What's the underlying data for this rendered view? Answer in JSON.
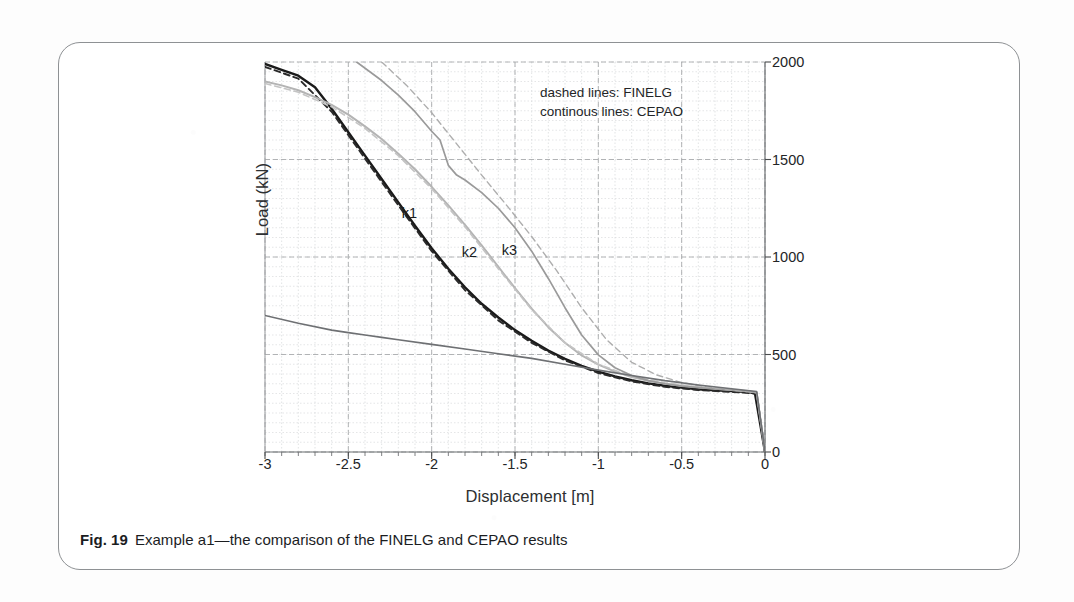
{
  "figure": {
    "caption_number": "Fig. 19",
    "caption_text": "Example a1—the comparison of the FINELG and CEPAO results"
  },
  "legend": {
    "line1": "dashed lines: FINELG",
    "line2": "continous lines: CEPAO"
  },
  "chart_data": {
    "type": "line",
    "title": "",
    "xlabel": "Displacement [m]",
    "ylabel": "Load (kN)",
    "xlim": [
      -3,
      0
    ],
    "ylim": [
      0,
      2000
    ],
    "xticks": [
      "-3",
      "-2.5",
      "-2",
      "-1.5",
      "-1",
      "-0.5",
      "0"
    ],
    "xtick_values": [
      -3,
      -2.5,
      -2,
      -1.5,
      -1,
      -0.5,
      0
    ],
    "yticks": [
      "2000",
      "1500",
      "1000",
      "500",
      "0"
    ],
    "ytick_values": [
      2000,
      1500,
      1000,
      500,
      0
    ],
    "yaxis_position": "right",
    "grid": true,
    "grid_style": "dashed minor grid",
    "legend_position": "inside top-right",
    "annotations": [
      {
        "text": "k1",
        "x": -2.18,
        "y": 1220
      },
      {
        "text": "k2",
        "x": -1.82,
        "y": 1020
      },
      {
        "text": "k3",
        "x": -1.58,
        "y": 1030
      }
    ],
    "series": [
      {
        "name": "k1 CEPAO",
        "style": "continuous",
        "color": "#1a1a1a",
        "x": [
          -3.0,
          -2.9,
          -2.8,
          -2.7,
          -2.6,
          -2.5,
          -2.4,
          -2.3,
          -2.2,
          -2.1,
          -2.0,
          -1.9,
          -1.8,
          -1.7,
          -1.6,
          -1.5,
          -1.4,
          -1.3,
          -1.2,
          -1.1,
          -1.0,
          -0.9,
          -0.8,
          -0.7,
          -0.6,
          -0.5,
          -0.4,
          -0.3,
          -0.2,
          -0.1,
          -0.06,
          -0.03,
          0.0
        ],
        "y": [
          1990,
          1960,
          1930,
          1870,
          1760,
          1640,
          1520,
          1400,
          1280,
          1160,
          1045,
          940,
          845,
          760,
          690,
          625,
          570,
          520,
          478,
          442,
          412,
          388,
          368,
          352,
          340,
          330,
          322,
          316,
          312,
          308,
          300,
          150,
          0
        ]
      },
      {
        "name": "k1 FINELG",
        "style": "dashed",
        "color": "#2a2a2a",
        "x": [
          -3.0,
          -2.8,
          -2.6,
          -2.4,
          -2.2,
          -2.0,
          -1.8,
          -1.6,
          -1.4,
          -1.2,
          -1.0,
          -0.8,
          -0.6,
          -0.4,
          -0.2,
          -0.05,
          0.0
        ],
        "y": [
          1975,
          1915,
          1745,
          1505,
          1265,
          1030,
          830,
          675,
          560,
          470,
          405,
          362,
          334,
          318,
          308,
          300,
          0
        ]
      },
      {
        "name": "k2 CEPAO",
        "style": "continuous",
        "color": "#b4b4b4",
        "x": [
          -3.0,
          -2.9,
          -2.8,
          -2.7,
          -2.6,
          -2.5,
          -2.4,
          -2.3,
          -2.2,
          -2.1,
          -2.0,
          -1.9,
          -1.8,
          -1.7,
          -1.6,
          -1.5,
          -1.4,
          -1.3,
          -1.2,
          -1.1,
          -1.0,
          -0.9,
          -0.8,
          -0.7,
          -0.6,
          -0.5,
          -0.4,
          -0.3,
          -0.2,
          -0.1,
          -0.05,
          0.0
        ],
        "y": [
          1900,
          1880,
          1855,
          1820,
          1780,
          1730,
          1670,
          1605,
          1530,
          1450,
          1360,
          1265,
          1165,
          1060,
          950,
          840,
          735,
          640,
          560,
          495,
          448,
          412,
          385,
          365,
          350,
          340,
          332,
          324,
          318,
          312,
          305,
          0
        ]
      },
      {
        "name": "k2 FINELG",
        "style": "dashed",
        "color": "#c4c4c4",
        "x": [
          -3.0,
          -2.8,
          -2.6,
          -2.4,
          -2.2,
          -2.0,
          -1.8,
          -1.6,
          -1.4,
          -1.2,
          -1.0,
          -0.8,
          -0.6,
          -0.4,
          -0.2,
          -0.05,
          0.0
        ],
        "y": [
          1890,
          1845,
          1770,
          1660,
          1520,
          1350,
          1155,
          940,
          730,
          560,
          450,
          388,
          355,
          334,
          318,
          305,
          0
        ]
      },
      {
        "name": "k3 CEPAO",
        "style": "continuous",
        "color": "#9a9a9a",
        "x": [
          -2.45,
          -2.3,
          -2.2,
          -2.1,
          -2.0,
          -1.95,
          -1.9,
          -1.85,
          -1.8,
          -1.7,
          -1.6,
          -1.5,
          -1.4,
          -1.3,
          -1.2,
          -1.1,
          -1.0,
          -0.9,
          -0.8,
          -0.7,
          -0.6,
          -0.5,
          -0.4,
          -0.3,
          -0.2,
          -0.1,
          -0.05,
          0.0
        ],
        "y": [
          2000,
          1905,
          1830,
          1745,
          1645,
          1600,
          1470,
          1420,
          1395,
          1330,
          1250,
          1150,
          1030,
          890,
          740,
          600,
          498,
          432,
          392,
          366,
          350,
          338,
          330,
          323,
          317,
          311,
          305,
          0
        ]
      },
      {
        "name": "k3 FINELG",
        "style": "dashed",
        "color": "#aeaeae",
        "x": [
          -2.3,
          -2.15,
          -2.0,
          -1.85,
          -1.7,
          -1.55,
          -1.4,
          -1.25,
          -1.1,
          -0.95,
          -0.8,
          -0.65,
          -0.5,
          -0.35,
          -0.2,
          -0.05,
          0.0
        ],
        "y": [
          2000,
          1880,
          1740,
          1580,
          1420,
          1265,
          1105,
          930,
          740,
          575,
          460,
          395,
          356,
          334,
          318,
          305,
          0
        ]
      },
      {
        "name": "lower line CEPAO",
        "style": "continuous",
        "color": "#6e7073",
        "x": [
          -3.0,
          -2.8,
          -2.6,
          -2.5,
          -2.4,
          -2.3,
          -2.2,
          -2.0,
          -1.8,
          -1.6,
          -1.4,
          -1.2,
          -1.0,
          -0.8,
          -0.6,
          -0.4,
          -0.2,
          -0.05,
          0.0
        ],
        "y": [
          700,
          660,
          625,
          612,
          600,
          588,
          576,
          552,
          528,
          504,
          480,
          450,
          420,
          392,
          366,
          344,
          324,
          310,
          0
        ]
      }
    ]
  }
}
